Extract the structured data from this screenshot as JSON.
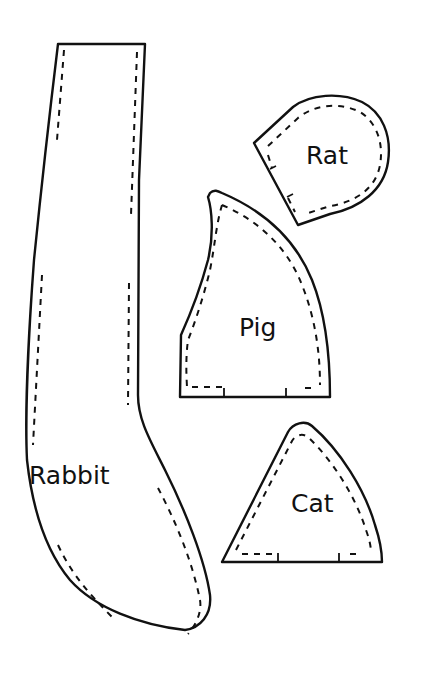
{
  "diagram": {
    "type": "sewing-pattern-pieces",
    "pieces": [
      {
        "id": "rabbit",
        "label": "Rabbit"
      },
      {
        "id": "rat",
        "label": "Rat"
      },
      {
        "id": "pig",
        "label": "Pig"
      },
      {
        "id": "cat",
        "label": "Cat"
      }
    ],
    "colors": {
      "line": "#111111",
      "background": "#ffffff"
    }
  }
}
